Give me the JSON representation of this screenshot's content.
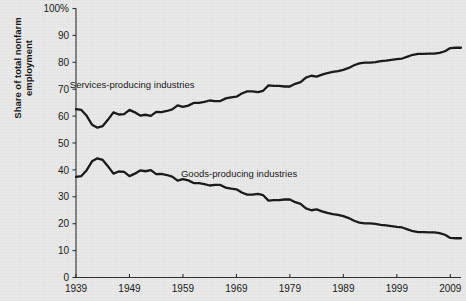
{
  "chart_data": {
    "type": "line",
    "title": "",
    "xlabel": "",
    "ylabel": "Share of total nonfarm employment",
    "ylim": [
      0,
      100
    ],
    "xlim": [
      1939,
      2011
    ],
    "grid": false,
    "legend": "inline-annotations",
    "y_ticks": [
      "0",
      "10",
      "20",
      "30",
      "40",
      "50",
      "60",
      "70",
      "80",
      "90",
      "100%"
    ],
    "y_tick_values": [
      0,
      10,
      20,
      30,
      40,
      50,
      60,
      70,
      80,
      90,
      100
    ],
    "x_ticks": [
      "1939",
      "1949",
      "1959",
      "1969",
      "1979",
      "1989",
      "1999",
      "2009"
    ],
    "x_tick_values": [
      1939,
      1949,
      1959,
      1969,
      1979,
      1989,
      1999,
      2009
    ],
    "annotations": [
      {
        "text": "Services-producing industries",
        "x": 1949.5,
        "y": 70.5
      },
      {
        "text": "Goods-producing industries",
        "x": 1969.5,
        "y": 37.5
      }
    ],
    "series": [
      {
        "name": "Services-producing industries",
        "color": "#151515",
        "x": [
          1939,
          1940,
          1941,
          1942,
          1943,
          1944,
          1945,
          1946,
          1947,
          1948,
          1949,
          1950,
          1951,
          1952,
          1953,
          1954,
          1955,
          1956,
          1957,
          1958,
          1959,
          1960,
          1961,
          1962,
          1963,
          1964,
          1965,
          1966,
          1967,
          1968,
          1969,
          1970,
          1971,
          1972,
          1973,
          1974,
          1975,
          1976,
          1977,
          1978,
          1979,
          1980,
          1981,
          1982,
          1983,
          1984,
          1985,
          1986,
          1987,
          1988,
          1989,
          1990,
          1991,
          1992,
          1993,
          1994,
          1995,
          1996,
          1997,
          1998,
          1999,
          2000,
          2001,
          2002,
          2003,
          2004,
          2005,
          2006,
          2007,
          2008,
          2009,
          2010,
          2011
        ],
        "values": [
          62.6,
          62.3,
          60.1,
          56.8,
          55.7,
          56.3,
          58.7,
          61.4,
          60.6,
          60.7,
          62.3,
          61.4,
          60.2,
          60.5,
          60.1,
          61.6,
          61.5,
          61.9,
          62.5,
          64.0,
          63.4,
          63.9,
          64.9,
          64.9,
          65.3,
          65.8,
          65.6,
          65.6,
          66.6,
          67.0,
          67.2,
          68.4,
          69.2,
          69.2,
          68.9,
          69.4,
          71.4,
          71.2,
          71.2,
          71.0,
          71.0,
          72.0,
          72.6,
          74.3,
          75.0,
          74.7,
          75.4,
          76.0,
          76.4,
          76.7,
          77.2,
          77.9,
          78.9,
          79.6,
          79.9,
          79.9,
          80.1,
          80.4,
          80.6,
          80.9,
          81.2,
          81.4,
          82.1,
          82.8,
          83.1,
          83.1,
          83.2,
          83.2,
          83.5,
          84.1,
          85.3,
          85.4,
          85.4
        ]
      },
      {
        "name": "Goods-producing industries",
        "color": "#151515",
        "x": [
          1939,
          1940,
          1941,
          1942,
          1943,
          1944,
          1945,
          1946,
          1947,
          1948,
          1949,
          1950,
          1951,
          1952,
          1953,
          1954,
          1955,
          1956,
          1957,
          1958,
          1959,
          1960,
          1961,
          1962,
          1963,
          1964,
          1965,
          1966,
          1967,
          1968,
          1969,
          1970,
          1971,
          1972,
          1973,
          1974,
          1975,
          1976,
          1977,
          1978,
          1979,
          1980,
          1981,
          1982,
          1983,
          1984,
          1985,
          1986,
          1987,
          1988,
          1989,
          1990,
          1991,
          1992,
          1993,
          1994,
          1995,
          1996,
          1997,
          1998,
          1999,
          2000,
          2001,
          2002,
          2003,
          2004,
          2005,
          2006,
          2007,
          2008,
          2009,
          2010,
          2011
        ],
        "values": [
          37.4,
          37.7,
          39.9,
          43.2,
          44.3,
          43.7,
          41.3,
          38.6,
          39.4,
          39.3,
          37.7,
          38.6,
          39.8,
          39.5,
          39.9,
          38.4,
          38.5,
          38.1,
          37.5,
          36.0,
          36.6,
          36.1,
          35.1,
          35.1,
          34.7,
          34.2,
          34.4,
          34.4,
          33.4,
          33.0,
          32.8,
          31.6,
          30.8,
          30.8,
          31.1,
          30.6,
          28.6,
          28.8,
          28.8,
          29.0,
          29.0,
          28.0,
          27.4,
          25.7,
          25.0,
          25.3,
          24.6,
          24.0,
          23.6,
          23.3,
          22.8,
          22.1,
          21.1,
          20.4,
          20.1,
          20.1,
          19.9,
          19.6,
          19.4,
          19.1,
          18.8,
          18.6,
          17.9,
          17.2,
          16.9,
          16.9,
          16.8,
          16.8,
          16.5,
          15.9,
          14.7,
          14.6,
          14.6
        ]
      }
    ]
  }
}
